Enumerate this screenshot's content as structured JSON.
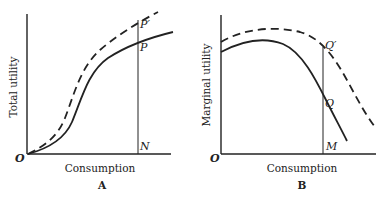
{
  "panels": [
    {
      "id": "A",
      "caption": "A",
      "xlabel": "Consumption",
      "ylabel": "Total utility",
      "origin_label": "O",
      "points": {
        "upper": "P′",
        "lower": "P",
        "base": "N"
      },
      "curves": [
        {
          "name": "original total utility",
          "style": "solid"
        },
        {
          "name": "shifted total utility",
          "style": "dashed"
        }
      ]
    },
    {
      "id": "B",
      "caption": "B",
      "xlabel": "Consumption",
      "ylabel": "Marginal utility",
      "origin_label": "O",
      "points": {
        "upper": "Q′",
        "lower": "Q",
        "base": "M"
      },
      "curves": [
        {
          "name": "original marginal utility",
          "style": "solid"
        },
        {
          "name": "shifted marginal utility",
          "style": "dashed"
        }
      ]
    }
  ],
  "colors": {
    "ink": "#222222",
    "background": "#ffffff"
  }
}
